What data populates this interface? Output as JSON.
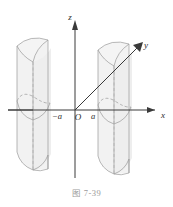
{
  "figure": {
    "caption": "图 7-39",
    "colors": {
      "surface_fill": "#f2f2f2",
      "surface_stroke": "#9a9a9a",
      "axis_stroke": "#3a3a3a",
      "dashed_stroke": "#9a9a9a",
      "label_color": "#2b2b2b",
      "caption_color": "#9a9a9a",
      "background": "#ffffff"
    },
    "axes": [
      {
        "name": "x",
        "label": "x",
        "label_x": 163,
        "label_y": 118,
        "direction": "right"
      },
      {
        "name": "y",
        "label": "y",
        "label_x": 146,
        "label_y": 48,
        "direction": "up-right"
      },
      {
        "name": "z",
        "label": "z",
        "label_x": 70,
        "label_y": 20,
        "direction": "up"
      }
    ],
    "origin": {
      "label": "O",
      "x": 78,
      "y": 120
    },
    "tick_marks": [
      {
        "label": "−a",
        "x": 57,
        "y": 119,
        "axis": "x",
        "value": -1
      },
      {
        "label": "a",
        "x": 93,
        "y": 119,
        "axis": "x",
        "value": 1
      }
    ],
    "surfaces": [
      {
        "name": "half-cylinder-left",
        "side": "negative-x",
        "opening": "left"
      },
      {
        "name": "half-cylinder-right",
        "side": "positive-x",
        "opening": "left"
      }
    ]
  }
}
